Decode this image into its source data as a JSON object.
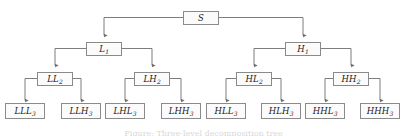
{
  "diagram": {
    "type": "binary-tree",
    "background_color": "#ffffff",
    "box_border_color": "#8a8a8a",
    "box_fill_color": "#fbfbfb",
    "connector_color": "#6e6e6e",
    "text_color": "#1a1a1a",
    "caption": "Figure: Three-level decomposition tree"
  },
  "nodes": {
    "root": {
      "base": "S",
      "sub": "",
      "level": 0
    },
    "level1": [
      {
        "base": "L",
        "sub": "1",
        "level": 1
      },
      {
        "base": "H",
        "sub": "1",
        "level": 1
      }
    ],
    "level2": [
      {
        "base": "LL",
        "sub": "2",
        "level": 2
      },
      {
        "base": "LH",
        "sub": "2",
        "level": 2
      },
      {
        "base": "HL",
        "sub": "2",
        "level": 2
      },
      {
        "base": "HH",
        "sub": "2",
        "level": 2
      }
    ],
    "level3": [
      {
        "base": "LLL",
        "sub": "3",
        "level": 3
      },
      {
        "base": "LLH",
        "sub": "3",
        "level": 3
      },
      {
        "base": "LHL",
        "sub": "3",
        "level": 3
      },
      {
        "base": "LHH",
        "sub": "3",
        "level": 3
      },
      {
        "base": "HLL",
        "sub": "3",
        "level": 3
      },
      {
        "base": "HLH",
        "sub": "3",
        "level": 3
      },
      {
        "base": "HHL",
        "sub": "3",
        "level": 3
      },
      {
        "base": "HHH",
        "sub": "3",
        "level": 3
      }
    ]
  }
}
